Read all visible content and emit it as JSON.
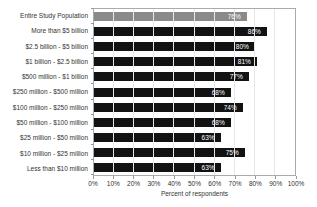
{
  "chart_data": {
    "type": "bar",
    "orientation": "horizontal",
    "title": "",
    "xlabel": "Percent of respondents",
    "ylabel": "",
    "categories": [
      "Entire Study Population",
      "More than $5 billion",
      "$2.5 billion - $5 billion",
      "$1 billion - $2.5 billion",
      "$500 million - $1 billion",
      "$250 million - $500 million",
      "$100 million - $250 million",
      "$50 million - $100 million",
      "$25 million - $50 million",
      "$10 million - $25 million",
      "Less than $10 million"
    ],
    "values": [
      76,
      86,
      80,
      81,
      77,
      68,
      74,
      68,
      63,
      75,
      63
    ],
    "value_labels": [
      "76%",
      "86%",
      "80%",
      "81%",
      "77%",
      "68%",
      "74%",
      "68%",
      "63%",
      "75%",
      "63%"
    ],
    "x_tick_labels": [
      "0%",
      "10%",
      "20%",
      "30%",
      "40%",
      "50%",
      "60%",
      "70%",
      "80%",
      "90%",
      "100%"
    ],
    "xlim": [
      0,
      100
    ],
    "grid": "vertical-only",
    "legend": "none",
    "highlight_index": 0,
    "colors": {
      "highlight_bar": "#8a8a8a",
      "default_bar": "#121212",
      "value_label_text": "#ffffff",
      "gridline": "#e7e7e7",
      "plot_border": "#aaaaaa",
      "axis_text": "#333333"
    }
  }
}
